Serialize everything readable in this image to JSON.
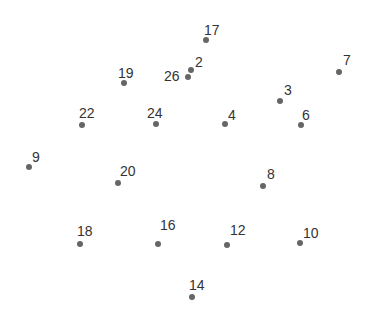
{
  "diagram": {
    "type": "connect-the-dots",
    "dot_color": "#666666",
    "label_color": "#333333",
    "points": [
      {
        "label": "17",
        "x": 206,
        "y": 40,
        "lx": 204,
        "ly": 23
      },
      {
        "label": "2",
        "x": 191,
        "y": 70,
        "lx": 195,
        "ly": 55
      },
      {
        "label": "26",
        "x": 188,
        "y": 77,
        "lx": 164,
        "ly": 69
      },
      {
        "label": "19",
        "x": 124,
        "y": 83,
        "lx": 118,
        "ly": 66
      },
      {
        "label": "7",
        "x": 339,
        "y": 72,
        "lx": 343,
        "ly": 53
      },
      {
        "label": "3",
        "x": 280,
        "y": 101,
        "lx": 284,
        "ly": 83
      },
      {
        "label": "22",
        "x": 82,
        "y": 125,
        "lx": 79,
        "ly": 106
      },
      {
        "label": "24",
        "x": 156,
        "y": 124,
        "lx": 147,
        "ly": 106
      },
      {
        "label": "4",
        "x": 225,
        "y": 124,
        "lx": 228,
        "ly": 108
      },
      {
        "label": "6",
        "x": 301,
        "y": 125,
        "lx": 302,
        "ly": 108
      },
      {
        "label": "9",
        "x": 29,
        "y": 167,
        "lx": 32,
        "ly": 150
      },
      {
        "label": "20",
        "x": 118,
        "y": 183,
        "lx": 120,
        "ly": 164
      },
      {
        "label": "8",
        "x": 263,
        "y": 186,
        "lx": 267,
        "ly": 167
      },
      {
        "label": "18",
        "x": 80,
        "y": 244,
        "lx": 77,
        "ly": 224
      },
      {
        "label": "16",
        "x": 158,
        "y": 244,
        "lx": 160,
        "ly": 218
      },
      {
        "label": "12",
        "x": 227,
        "y": 245,
        "lx": 230,
        "ly": 223
      },
      {
        "label": "10",
        "x": 300,
        "y": 243,
        "lx": 303,
        "ly": 226
      },
      {
        "label": "14",
        "x": 192,
        "y": 297,
        "lx": 189,
        "ly": 278
      }
    ]
  }
}
